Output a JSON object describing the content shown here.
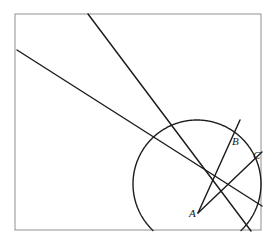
{
  "figure": {
    "background_color": "#ffffff",
    "frame": {
      "name": "bounding-frame",
      "x": 15,
      "y": 14,
      "width": 246,
      "height": 216,
      "stroke_color": "#9a9a9a",
      "stroke_width": 1.1
    },
    "stroke_color": "#1c1c1c",
    "labels": [
      {
        "id": "A",
        "text": "A",
        "x": 189,
        "y": 217,
        "point_x": 198,
        "point_y": 213
      },
      {
        "id": "B",
        "text": "B",
        "x": 232,
        "y": 145,
        "point_x": 228,
        "point_y": 150
      },
      {
        "id": "C",
        "text": "C",
        "x": 253,
        "y": 159,
        "point_x": 249,
        "point_y": 163
      }
    ],
    "circle": {
      "name": "main-circle",
      "center_x": 197,
      "center_y": 184,
      "radius": 64,
      "arc_path": "M 133.6 196.5 A 64 64 0 0 1 264.5 166.0"
    },
    "lines": [
      {
        "id": "line-1",
        "name": "long-line-from-left-edge",
        "x1": 17,
        "y1": 50,
        "x2": 262,
        "y2": 206
      },
      {
        "id": "line-2",
        "name": "steep-line-from-top-edge",
        "x1": 88,
        "y1": 14,
        "x2": 251,
        "y2": 231
      },
      {
        "id": "line-3",
        "name": "ray-A-to-B-extended",
        "x1": 198,
        "y1": 213,
        "x2": 240,
        "y2": 120
      },
      {
        "id": "line-4",
        "name": "ray-A-to-C-extended",
        "x1": 198,
        "y1": 213,
        "x2": 262,
        "y2": 152
      }
    ]
  }
}
